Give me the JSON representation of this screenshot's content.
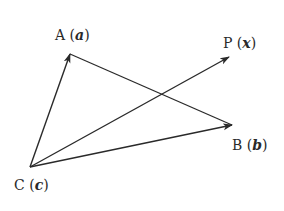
{
  "diagram": {
    "type": "vector-triangle",
    "points": {
      "A": {
        "name": "A",
        "vector": "a",
        "x": 70,
        "y": 54
      },
      "B": {
        "name": "B",
        "vector": "b",
        "x": 232,
        "y": 125
      },
      "C": {
        "name": "C",
        "vector": "c",
        "x": 30,
        "y": 167
      },
      "P": {
        "name": "P",
        "vector": "x",
        "x": 229,
        "y": 57
      }
    },
    "segments": [
      {
        "from": "C",
        "to": "A",
        "arrow": true
      },
      {
        "from": "A",
        "to": "B",
        "arrow": false
      },
      {
        "from": "C",
        "to": "B",
        "arrow": true
      },
      {
        "from": "C",
        "to": "P",
        "arrow": true
      }
    ],
    "labels": {
      "A": {
        "letter": "A",
        "open": " (",
        "var": "a",
        "close": ")"
      },
      "B": {
        "letter": "B",
        "open": " (",
        "var": "b",
        "close": ")"
      },
      "C": {
        "letter": "C",
        "open": " (",
        "var": "c",
        "close": ")"
      },
      "P": {
        "letter": "P",
        "open": " (",
        "var": "x",
        "close": ")"
      }
    },
    "colors": {
      "stroke": "#2a2a2a",
      "background": "#ffffff"
    }
  }
}
